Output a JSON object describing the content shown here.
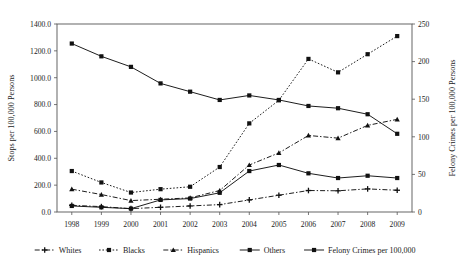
{
  "chart_data": {
    "type": "line",
    "title": "",
    "xlabel": "",
    "ylabel": "Stops per 100,000 Persons",
    "y2label": "Felony Crimes per 100,000 Persons",
    "categories": [
      "1998",
      "1999",
      "2000",
      "2001",
      "2002",
      "2003",
      "2004",
      "2005",
      "2006",
      "2007",
      "2008",
      "2009"
    ],
    "ylim": [
      0,
      1400
    ],
    "ytick_labels": [
      "0.0",
      "200.0",
      "400.0",
      "600.0",
      "800.0",
      "1000.0",
      "1200.0",
      "1400.0"
    ],
    "ytick_values": [
      0,
      200,
      400,
      600,
      800,
      1000,
      1200,
      1400
    ],
    "y2lim": [
      0,
      250
    ],
    "y2tick_labels": [
      "0",
      "50",
      "100",
      "150",
      "200",
      "250"
    ],
    "y2tick_values": [
      0,
      50,
      100,
      150,
      200,
      250
    ],
    "grid": false,
    "legend_position": "bottom",
    "series": [
      {
        "name": "Whites",
        "axis": "left",
        "marker": "plus",
        "dash": "dashdot",
        "values": [
          50,
          40,
          25,
          35,
          45,
          55,
          90,
          125,
          160,
          158,
          172,
          162
        ]
      },
      {
        "name": "Blacks",
        "axis": "left",
        "marker": "square",
        "dash": "dotted",
        "values": [
          305,
          220,
          145,
          170,
          188,
          335,
          660,
          832,
          1140,
          1040,
          1175,
          1310
        ]
      },
      {
        "name": "Hispanics",
        "axis": "left",
        "marker": "triangle",
        "dash": "dashdot",
        "values": [
          170,
          130,
          85,
          95,
          105,
          160,
          350,
          440,
          570,
          550,
          645,
          690
        ]
      },
      {
        "name": "Others",
        "axis": "left",
        "marker": "square",
        "dash": "solid",
        "values": [
          45,
          35,
          25,
          90,
          100,
          143,
          305,
          350,
          288,
          253,
          270,
          253
        ]
      },
      {
        "name": "Felony Crimes per 100,000",
        "axis": "right",
        "marker": "square",
        "dash": "solid",
        "values": [
          224,
          207,
          193,
          171,
          160,
          149,
          155,
          149,
          141,
          138,
          130,
          104
        ]
      }
    ]
  },
  "legend": {
    "items": [
      {
        "label": "Whites"
      },
      {
        "label": "Blacks"
      },
      {
        "label": "Hispanics"
      },
      {
        "label": "Others"
      },
      {
        "label": "Felony Crimes per 100,000"
      }
    ]
  }
}
